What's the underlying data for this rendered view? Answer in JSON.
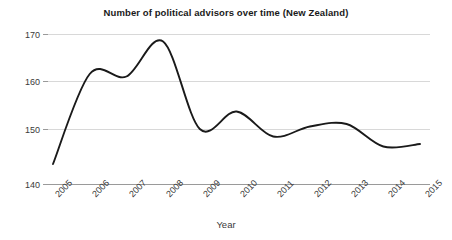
{
  "chart_data": {
    "type": "line",
    "title": "Number of political advisors over time (New Zealand)",
    "xlabel": "Year",
    "ylabel": "",
    "xlim": [
      2005,
      2015
    ],
    "ylim": [
      140,
      170
    ],
    "grid": true,
    "legend": false,
    "line_color": "#1a1a1a",
    "grid_color": "#d8d8d8",
    "axis_color": "#9a9a9a",
    "x_tick_labels": [
      "2005",
      "2006",
      "2007",
      "2008",
      "2009",
      "2010",
      "2011",
      "2012",
      "2013",
      "2014",
      "2015"
    ],
    "y_tick_labels": [
      "140",
      "150",
      "160",
      "170"
    ],
    "y_ticks": [
      140,
      150,
      160,
      170
    ],
    "x": [
      2005,
      2006,
      2007,
      2008,
      2009,
      2010,
      2011,
      2012,
      2013,
      2014,
      2015
    ],
    "values": [
      144,
      162,
      161.5,
      168.5,
      151,
      154.5,
      149.5,
      151.5,
      152,
      147.5,
      148
    ],
    "series": [
      {
        "name": "Political advisors",
        "values": [
          144,
          162,
          161.5,
          168.5,
          151,
          154.5,
          149.5,
          151.5,
          152,
          147.5,
          148
        ]
      }
    ],
    "annotations": []
  }
}
